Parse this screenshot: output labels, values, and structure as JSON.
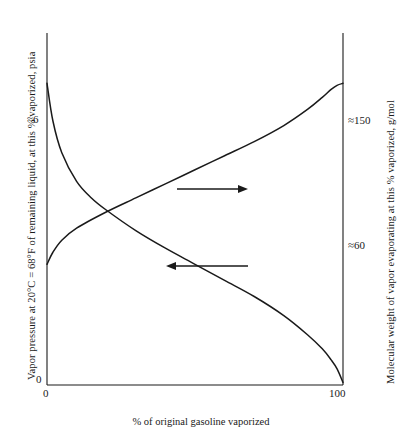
{
  "figure": {
    "background_color": "#ffffff",
    "line_color": "#1a1a1a"
  },
  "axes": {
    "left": {
      "title": "Vapor pressure at 20°C = 68°F of remaining liquid, at this % vaporized, psia",
      "ticks": [
        {
          "label": "0",
          "value": 0
        },
        {
          "label": "≈6",
          "value": 6
        }
      ]
    },
    "right": {
      "title": "Molecular weight of vapor evaporating at this % vaporized, g/mol",
      "ticks": [
        {
          "label": "≈60",
          "value": 60
        },
        {
          "label": "≈150",
          "value": 150
        }
      ]
    },
    "bottom": {
      "title": "% of original gasoline vaporized",
      "ticks": [
        {
          "label": "0",
          "value": 0
        },
        {
          "label": "100",
          "value": 100
        }
      ]
    }
  },
  "annotations": [
    {
      "name": "arrow-to-right-axis",
      "direction": "right",
      "meaning": "rising curve reads on right axis"
    },
    {
      "name": "arrow-to-left-axis",
      "direction": "left",
      "meaning": "falling curve reads on left axis"
    }
  ],
  "chart_data": {
    "type": "line",
    "title": "",
    "subtitle": "",
    "xlabel": "% of original gasoline vaporized",
    "ylabel": "Vapor pressure at 20°C = 68°F of remaining liquid, at this % vaporized, psia",
    "y2label": "Molecular weight of vapor evaporating at this % vaporized, g/mol",
    "xlim": [
      0,
      100
    ],
    "ylim": [
      0,
      7.0
    ],
    "y2lim": [
      0,
      175
    ],
    "grid": false,
    "legend": "none",
    "xticks": [
      0,
      100
    ],
    "xticklabels": [
      "0",
      "100"
    ],
    "yticks": [
      0,
      6
    ],
    "yticklabels": [
      "0",
      "≈6"
    ],
    "y2ticks": [
      60,
      150
    ],
    "y2ticklabels": [
      "≈60",
      "≈150"
    ],
    "series": [
      {
        "name": "Vapor pressure of remaining liquid",
        "axis": "left",
        "units": "psia",
        "x": [
          0,
          2,
          5,
          10,
          15,
          20,
          30,
          40,
          50,
          60,
          70,
          80,
          88,
          93,
          96,
          98,
          100
        ],
        "values": [
          6.0,
          5.25,
          4.62,
          4.05,
          3.72,
          3.48,
          3.07,
          2.72,
          2.4,
          2.08,
          1.76,
          1.38,
          1.0,
          0.72,
          0.5,
          0.32,
          0.05
        ]
      },
      {
        "name": "Molecular weight of vapor evaporating",
        "axis": "right",
        "units": "g/mol",
        "x": [
          0,
          2,
          5,
          10,
          20,
          30,
          40,
          50,
          60,
          70,
          80,
          88,
          93,
          96,
          98,
          100
        ],
        "values": [
          60,
          66,
          72,
          78,
          86,
          93,
          100,
          107,
          114,
          121,
          129,
          137,
          143,
          147,
          149,
          150
        ]
      }
    ]
  }
}
